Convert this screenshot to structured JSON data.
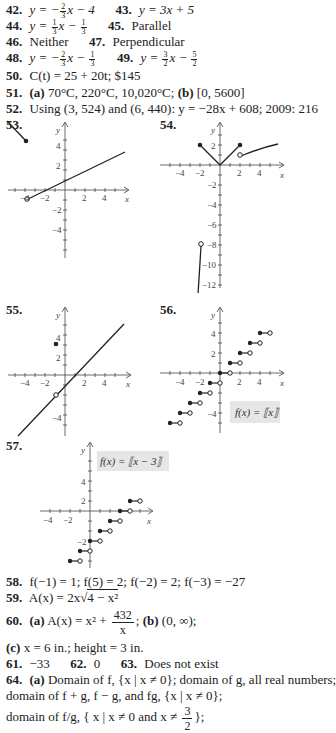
{
  "answers": {
    "a42": {
      "num": "42.",
      "text_pre": "y = −",
      "frac_n": "2",
      "frac_d": "3",
      "text_post": "x − 4"
    },
    "a43": {
      "num": "43.",
      "text": "y = 3x + 5"
    },
    "a44": {
      "num": "44.",
      "text_pre": "y = ",
      "frac1_n": "1",
      "frac1_d": "3",
      "mid": "x − ",
      "frac2_n": "1",
      "frac2_d": "3"
    },
    "a45": {
      "num": "45.",
      "text": "Parallel"
    },
    "a46": {
      "num": "46.",
      "text": "Neither"
    },
    "a47": {
      "num": "47.",
      "text": "Perpendicular"
    },
    "a48": {
      "num": "48.",
      "text_pre": "y = −",
      "frac1_n": "2",
      "frac1_d": "3",
      "mid": "x − ",
      "frac2_n": "1",
      "frac2_d": "3"
    },
    "a49": {
      "num": "49.",
      "text_pre": "y = ",
      "frac1_n": "3",
      "frac1_d": "2",
      "mid": "x − ",
      "frac2_n": "5",
      "frac2_d": "2"
    },
    "a50": {
      "num": "50.",
      "text": "C(t) = 25 + 20t; $145"
    },
    "a51": {
      "num": "51.",
      "part_a": "(a)",
      "text_a": "70°C, 220°C, 10,020°C;",
      "part_b": "(b)",
      "text_b": "[0, 5600]"
    },
    "a52": {
      "num": "52.",
      "text": "Using (3, 524) and (6, 440): y = −28x + 608; 2009: 216"
    },
    "a58": {
      "num": "58.",
      "text": "f(−1) = 1; f(5) = 2; f(−2) = 2; f(−3) = −27"
    },
    "a59": {
      "num": "59.",
      "text_pre": "A(x) = 2x√",
      "radicand": "4 − x²"
    },
    "a60": {
      "num": "60.",
      "part_a": "(a)",
      "text_a": "A(x) = x² + ",
      "frac_n": "432",
      "frac_d": "x",
      "sep": ";",
      "part_b": "(b)",
      "text_b": "(0, ∞);"
    },
    "a60c": {
      "part_c": "(c)",
      "text_c": "x = 6 in.; height = 3 in."
    },
    "a61": {
      "num": "61.",
      "text": "−33"
    },
    "a62": {
      "num": "62.",
      "text": "0"
    },
    "a63": {
      "num": "63.",
      "text": "Does not exist"
    },
    "a64": {
      "num": "64.",
      "part_a": "(a)",
      "line1": "Domain of f, {x | x ≠ 0}; domain of g, all real numbers;",
      "line2": "domain of f + g, f − g, and fg, {x | x ≠ 0};",
      "line3_pre": "domain of f/g, ",
      "line3_set": "{ x | x ≠ 0 and x ≠ ",
      "frac_n": "3",
      "frac_d": "2",
      "line3_post": "};"
    }
  },
  "graphs": {
    "g53": {
      "label": "53.",
      "x_axis": "x",
      "y_axis": "y",
      "x_ticks": [
        "−4",
        "−2",
        "2",
        "4"
      ],
      "y_ticks": [
        "4",
        "2",
        "−2",
        "−4"
      ]
    },
    "g54": {
      "label": "54.",
      "x_axis": "x",
      "y_axis": "y",
      "x_ticks": [
        "−4",
        "−2",
        "2",
        "4"
      ],
      "y_ticks": [
        "2",
        "−2",
        "−4",
        "−6",
        "−8",
        "−10",
        "−12"
      ]
    },
    "g55": {
      "label": "55.",
      "x_axis": "x",
      "y_axis": "y",
      "x_ticks": [
        "−4",
        "−2",
        "2",
        "4"
      ],
      "y_ticks": [
        "4",
        "2",
        "−4"
      ]
    },
    "g56": {
      "label": "56.",
      "x_axis": "x",
      "y_axis": "y",
      "x_ticks": [
        "−4",
        "−2",
        "2",
        "4"
      ],
      "y_ticks": [
        "4",
        "2",
        "−4"
      ],
      "caption": "f(x) = ⟦x⟧"
    },
    "g57": {
      "label": "57.",
      "x_axis": "x",
      "y_axis": "y",
      "x_ticks": [
        "−4",
        "−2"
      ],
      "y_ticks": [
        "4",
        "2",
        "−2"
      ],
      "caption": "f(x) = ⟦x − 3⟧"
    }
  },
  "colors": {
    "ink": "#222222",
    "caption_bg": "#e6e6e6"
  }
}
